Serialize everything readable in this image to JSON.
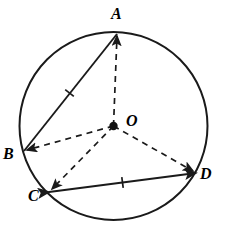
{
  "figure": {
    "stroke_color": "#1a1a1a",
    "background_color": "#ffffff",
    "dash_pattern": "6 5"
  },
  "circle": {
    "center_label": "O",
    "center_x": 113.5,
    "center_y": 126,
    "radius": 94,
    "dot_radius": 4.2,
    "center_label_x": 126,
    "center_label_y": 113
  },
  "points": [
    {
      "id": "A",
      "label": "A",
      "x": 117,
      "y": 34,
      "label_x": 111,
      "label_y": 6,
      "label_name": "point-label-a"
    },
    {
      "id": "B",
      "label": "B",
      "x": 24,
      "y": 151,
      "label_x": 3,
      "label_y": 146,
      "label_name": "point-label-b"
    },
    {
      "id": "C",
      "label": "C",
      "x": 49,
      "y": 192,
      "label_x": 28,
      "label_y": 188,
      "label_name": "point-label-c"
    },
    {
      "id": "D",
      "label": "D",
      "x": 196,
      "y": 173,
      "label_x": 200,
      "label_y": 166,
      "label_name": "point-label-d"
    }
  ],
  "chords": [
    {
      "id": "AB",
      "from": "A",
      "to": "B",
      "style": "solid",
      "x1": 117,
      "y1": 34,
      "x2": 24,
      "y2": 151,
      "tick_marks": 1,
      "tick_x": 69.5,
      "tick_y": 93,
      "arrow_start": false,
      "arrow_end": false
    },
    {
      "id": "CD",
      "from": "C",
      "to": "D",
      "style": "solid",
      "x1": 49,
      "y1": 192,
      "x2": 196,
      "y2": 173,
      "tick_marks": 1,
      "tick_x": 122.5,
      "tick_y": 182.5,
      "arrow_start": true,
      "arrow_end": true
    }
  ],
  "radii": [
    {
      "id": "OA",
      "to": "A",
      "style": "dashed",
      "x1": 113.5,
      "y1": 126,
      "x2": 117,
      "y2": 36,
      "arrow_end": true
    },
    {
      "id": "OB",
      "to": "B",
      "style": "dashed",
      "x1": 113.5,
      "y1": 126,
      "x2": 27,
      "y2": 150,
      "arrow_end": true
    },
    {
      "id": "OC",
      "to": "C",
      "style": "dashed",
      "x1": 113.5,
      "y1": 126,
      "x2": 52,
      "y2": 189,
      "arrow_end": true
    },
    {
      "id": "OD",
      "to": "D",
      "style": "dashed",
      "x1": 113.5,
      "y1": 126,
      "x2": 193,
      "y2": 171,
      "arrow_end": true
    }
  ]
}
